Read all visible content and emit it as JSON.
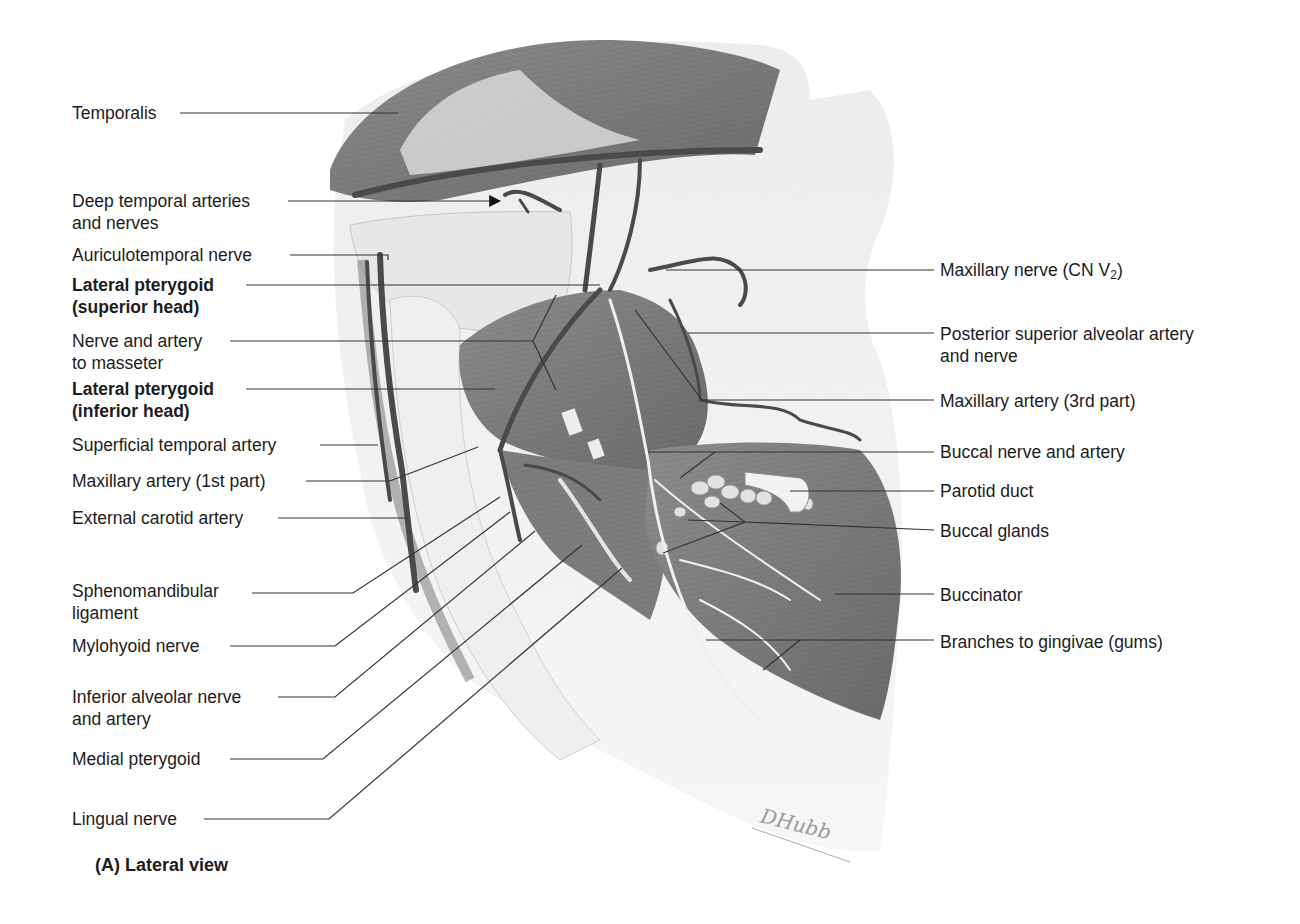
{
  "figure": {
    "caption": "(A) Lateral view",
    "signature": "DHubb",
    "view": "Lateral view",
    "style": "grayscale anatomical illustration"
  },
  "labels_left": [
    {
      "id": "temporalis",
      "lines": [
        "Temporalis"
      ],
      "bold": false
    },
    {
      "id": "deep-temporal",
      "lines": [
        "Deep temporal arteries",
        "and nerves"
      ],
      "bold": false,
      "arrow": true
    },
    {
      "id": "auriculotemporal",
      "lines": [
        "Auriculotemporal nerve"
      ],
      "bold": false
    },
    {
      "id": "lat-pterygoid-sup",
      "lines": [
        "Lateral pterygoid",
        "(superior head)"
      ],
      "bold": true
    },
    {
      "id": "nerve-artery-masseter",
      "lines": [
        "Nerve and artery",
        "to masseter"
      ],
      "bold": false
    },
    {
      "id": "lat-pterygoid-inf",
      "lines": [
        "Lateral pterygoid",
        "(inferior head)"
      ],
      "bold": true
    },
    {
      "id": "superficial-temporal",
      "lines": [
        "Superficial temporal artery"
      ],
      "bold": false
    },
    {
      "id": "maxillary-1st",
      "lines": [
        "Maxillary artery (1st part)"
      ],
      "bold": false
    },
    {
      "id": "external-carotid",
      "lines": [
        "External carotid artery"
      ],
      "bold": false
    },
    {
      "id": "sphenomandibular",
      "lines": [
        "Sphenomandibular",
        "ligament"
      ],
      "bold": false
    },
    {
      "id": "mylohyoid",
      "lines": [
        "Mylohyoid nerve"
      ],
      "bold": false
    },
    {
      "id": "inferior-alveolar",
      "lines": [
        "Inferior alveolar nerve",
        "and artery"
      ],
      "bold": false
    },
    {
      "id": "medial-pterygoid",
      "lines": [
        "Medial pterygoid"
      ],
      "bold": false
    },
    {
      "id": "lingual",
      "lines": [
        "Lingual nerve"
      ],
      "bold": false
    }
  ],
  "labels_right": [
    {
      "id": "maxillary-nerve",
      "text": "Maxillary nerve (CN V",
      "sub": "2",
      "suffix": ")"
    },
    {
      "id": "post-sup-alveolar",
      "lines": [
        "Posterior superior alveolar artery",
        "and nerve"
      ]
    },
    {
      "id": "maxillary-3rd",
      "lines": [
        "Maxillary artery (3rd part)"
      ]
    },
    {
      "id": "buccal-nerve-artery",
      "lines": [
        "Buccal nerve and artery"
      ]
    },
    {
      "id": "parotid-duct",
      "lines": [
        "Parotid duct"
      ]
    },
    {
      "id": "buccal-glands",
      "lines": [
        "Buccal glands"
      ]
    },
    {
      "id": "buccinator",
      "lines": [
        "Buccinator"
      ]
    },
    {
      "id": "gingivae",
      "lines": [
        "Branches to gingivae (gums)"
      ]
    }
  ],
  "colors": {
    "text": "#1c1c1c",
    "leader_line": "#333333",
    "muscle_dark": "#6f6f6f",
    "muscle_mid": "#8a8a8a",
    "skin_light": "#e4e4e4",
    "bone_light": "#eeeeee",
    "vessel": "#4a4a4a"
  }
}
